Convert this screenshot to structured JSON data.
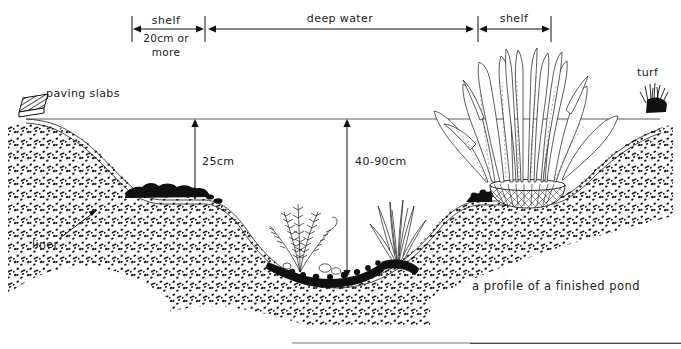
{
  "figure": {
    "title": "a profile of a finished pond",
    "caption": "a profile of a finished pond",
    "medium": "pen-and-ink line drawing",
    "width": 681,
    "height": 349,
    "background_color": "#ffffff",
    "ink_color": "#111111"
  },
  "dimensions": {
    "shelf_left": {
      "label": "shelf",
      "sublabel_line1": "20cm or",
      "sublabel_line2": "more",
      "x_start": 132,
      "x_end": 205,
      "y": 27
    },
    "deep_water": {
      "label": "deep water",
      "x_start": 207,
      "x_end": 474,
      "y": 27
    },
    "shelf_right": {
      "label": "shelf",
      "x_start": 478,
      "x_end": 551,
      "y": 27
    },
    "depth_shallow": {
      "label": "25cm",
      "x": 195,
      "y_top": 120,
      "y_bottom": 200
    },
    "depth_deep": {
      "label": "40-90cm",
      "x": 347,
      "y_top": 120,
      "y_bottom": 278
    }
  },
  "annotations": {
    "paving_slabs": {
      "label": "paving slabs",
      "x": 47,
      "y": 96
    },
    "liner": {
      "label": "liner",
      "x": 32,
      "y": 243,
      "leader_from_x": 56,
      "leader_from_y": 236,
      "leader_to_x": 96,
      "leader_to_y": 209
    },
    "turf": {
      "label": "turf",
      "x": 641,
      "y": 72
    },
    "caption": {
      "label": "a profile of a finished pond",
      "x": 472,
      "y": 286
    }
  },
  "features": {
    "waterline_y": 119,
    "waterline_x_start": 26,
    "waterline_x_end": 660,
    "ground_left_x": 8,
    "ground_right_x": 673,
    "shelf_left_depth_y": 199,
    "shelf_right_depth_y": 200,
    "pond_bottom_y": 280,
    "elements": [
      "paving-slabs",
      "pond-liner",
      "soil-stipple",
      "left-planting-shelf",
      "gravel-bed",
      "oxygenating-plant",
      "marginal-grass-clump",
      "reed-plant-in-mesh-basket",
      "turf-edge",
      "water-surface-line"
    ]
  },
  "colors": {
    "ink": "#111111",
    "paper": "#ffffff",
    "soil_dots": "#1b1b1b",
    "gravel": "#101010",
    "waterline": "#333333"
  }
}
